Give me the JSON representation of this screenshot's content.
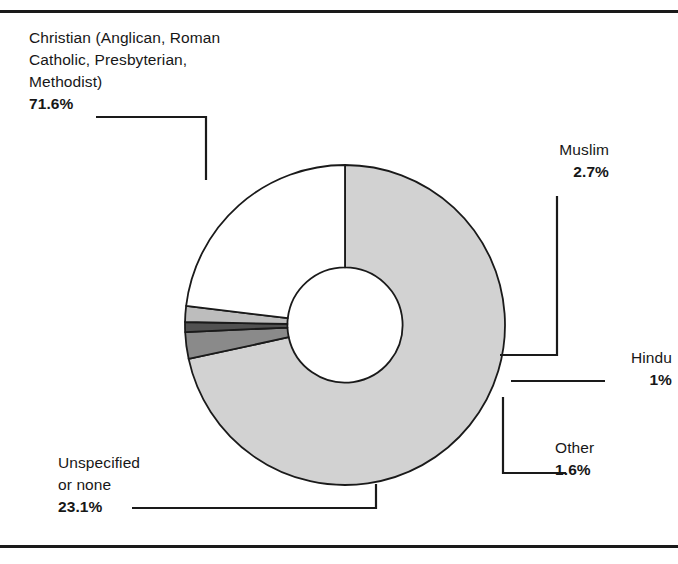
{
  "figure": {
    "background": "#ffffff",
    "rule_color": "#1a1a1a",
    "width": 678,
    "height": 564
  },
  "chart_data": {
    "type": "pie",
    "title": "",
    "subtitle": "",
    "xlabel": "",
    "ylabel": "",
    "legend_position": "callout-labels",
    "grid": false,
    "donut": true,
    "inner_radius_ratio": 0.36,
    "start_angle_deg": -90,
    "direction": "clockwise",
    "units": "percent",
    "total": 100,
    "categories": [
      "Christian (Anglican, Roman Catholic, Presbyterian, Methodist)",
      "Muslim",
      "Hindu",
      "Other",
      "Unspecified or none"
    ],
    "values": [
      71.6,
      2.7,
      1.0,
      1.6,
      23.1
    ],
    "value_labels": [
      "71.6%",
      "2.7%",
      "1%",
      "1.6%",
      "23.1%"
    ],
    "colors": [
      "#d2d2d2",
      "#8a8a8a",
      "#515151",
      "#bdbdbd",
      "#ffffff"
    ],
    "slices": [
      {
        "name": "Christian",
        "value": 71.6,
        "label": "71.6%",
        "color": "#d2d2d2"
      },
      {
        "name": "Muslim",
        "value": 2.7,
        "label": "2.7%",
        "color": "#8a8a8a"
      },
      {
        "name": "Hindu",
        "value": 1.0,
        "label": "1%",
        "color": "#515151"
      },
      {
        "name": "Other",
        "value": 1.6,
        "label": "1.6%",
        "color": "#bdbdbd"
      },
      {
        "name": "Unspecified or none",
        "value": 23.1,
        "label": "23.1%",
        "color": "#ffffff"
      }
    ]
  },
  "labels": {
    "christian": {
      "line1": "Christian (Anglican, Roman",
      "line2": "Catholic, Presbyterian,",
      "line3": "Methodist)",
      "percent": "71.6%"
    },
    "muslim": {
      "name": "Muslim",
      "percent": "2.7%"
    },
    "hindu": {
      "name": "Hindu",
      "percent": "1%"
    },
    "other": {
      "name": "Other",
      "percent": "1.6%"
    },
    "unspecified": {
      "line1": "Unspecified",
      "line2": "or none",
      "percent": "23.1%"
    }
  }
}
